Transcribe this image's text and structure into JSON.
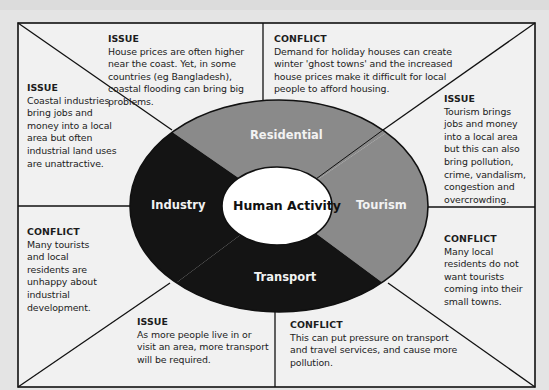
{
  "diagram": {
    "title": "Human Activity",
    "segments": [
      {
        "name": "Residential",
        "color": "#8a8a8a"
      },
      {
        "name": "Tourism",
        "color": "#8a8a8a"
      },
      {
        "name": "Transport",
        "color": "#141414"
      },
      {
        "name": "Industry",
        "color": "#141414"
      }
    ],
    "panels": {
      "residential_issue": {
        "heading": "ISSUE",
        "text": "House prices are often higher near the coast. Yet, in some countries (eg Bangladesh), coastal flooding can bring big problems."
      },
      "residential_conflict": {
        "heading": "CONFLICT",
        "text": "Demand for holiday houses can create winter 'ghost towns' and the increased house prices make it difficult for local people to afford housing."
      },
      "industry_issue": {
        "heading": "ISSUE",
        "text": "Coastal industries bring jobs and money into a local area but often industrial land uses are unattractive."
      },
      "industry_conflict": {
        "heading": "CONFLICT",
        "text": "Many tourists and local residents are unhappy about industrial development."
      },
      "tourism_issue": {
        "heading": "ISSUE",
        "text": "Tourism brings jobs and money into a local area but this can also bring pollution, crime, vandalism, congestion and overcrowding."
      },
      "tourism_conflict": {
        "heading": "CONFLICT",
        "text": "Many local residents do not want tourists coming into their small towns."
      },
      "transport_issue": {
        "heading": "ISSUE",
        "text": "As more people live in or visit an area, more transport will be required."
      },
      "transport_conflict": {
        "heading": "CONFLICT",
        "text": "This can put pressure on transport and travel services, and cause more pollution."
      }
    },
    "colors": {
      "frame": "#111111",
      "panel_bg": "#f1f1f1",
      "page_bg": "#e4e4e4",
      "gray_segment": "#8a8a8a",
      "dark_segment": "#141414",
      "center_fill": "#ffffff"
    }
  }
}
